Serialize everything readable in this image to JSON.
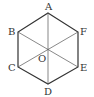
{
  "diagram": {
    "type": "regular-hexagon",
    "colors": {
      "edge": "#333333",
      "diagonal": "#555555",
      "label": "#333333",
      "background": "#ffffff"
    },
    "vertices": [
      {
        "name": "A",
        "x": 48,
        "y": 13,
        "label_x": 45,
        "label_y": 10
      },
      {
        "name": "F",
        "x": 78,
        "y": 32,
        "label_x": 80,
        "label_y": 35
      },
      {
        "name": "E",
        "x": 78,
        "y": 67,
        "label_x": 80,
        "label_y": 71
      },
      {
        "name": "D",
        "x": 48,
        "y": 84,
        "label_x": 44,
        "label_y": 95
      },
      {
        "name": "C",
        "x": 18,
        "y": 67,
        "label_x": 8,
        "label_y": 71
      },
      {
        "name": "B",
        "x": 18,
        "y": 32,
        "label_x": 8,
        "label_y": 35
      }
    ],
    "center": {
      "name": "O",
      "x": 48,
      "y": 49,
      "label_x": 38,
      "label_y": 62
    },
    "diagonals": [
      [
        "A",
        "D"
      ],
      [
        "B",
        "E"
      ],
      [
        "C",
        "F"
      ]
    ]
  }
}
